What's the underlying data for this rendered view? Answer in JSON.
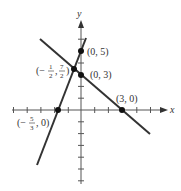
{
  "diagram": {
    "type": "coordinate-graph",
    "axes": {
      "x_label": "x",
      "y_label": "y",
      "origin_px": [
        81,
        110
      ],
      "unit_x_px": 13.7,
      "unit_y_px": 11.8,
      "x_range": [
        -5,
        7
      ],
      "y_range": [
        -6,
        8
      ]
    },
    "lines": [
      {
        "name": "steep-line",
        "equation": "y = 3x + 5",
        "from": [
          -3.2,
          -4.7
        ],
        "to": [
          0.35,
          6.1
        ]
      },
      {
        "name": "descending-line",
        "equation": "y = -x + 3",
        "from": [
          -3,
          6
        ],
        "to": [
          5,
          -2
        ]
      }
    ],
    "points": [
      {
        "name": "point-0-5",
        "x": 0,
        "y": 5,
        "label": "(0, 5)",
        "label_pos": "right"
      },
      {
        "name": "point-intersection",
        "x": -0.5,
        "y": 3.5,
        "label_pre": "(−",
        "label_frac1_num": "1",
        "label_frac1_den": "2",
        "label_mid": ", ",
        "label_frac2_num": "7",
        "label_frac2_den": "2",
        "label_post": ")",
        "label_pos": "left"
      },
      {
        "name": "point-0-3",
        "x": 0,
        "y": 3,
        "label": "(0, 3)",
        "label_pos": "right"
      },
      {
        "name": "point-3-0",
        "x": 3,
        "y": 0,
        "label": "(3, 0)",
        "label_pos": "above"
      },
      {
        "name": "point-neg5over3-0",
        "x": -1.6667,
        "y": 0,
        "label_pre": "(−",
        "label_frac_num": "5",
        "label_frac_den": "3",
        "label_post": ", 0)",
        "label_pos": "below-left"
      }
    ],
    "colors": {
      "line": "#333333",
      "axis": "#555555",
      "point": "#111111"
    }
  }
}
